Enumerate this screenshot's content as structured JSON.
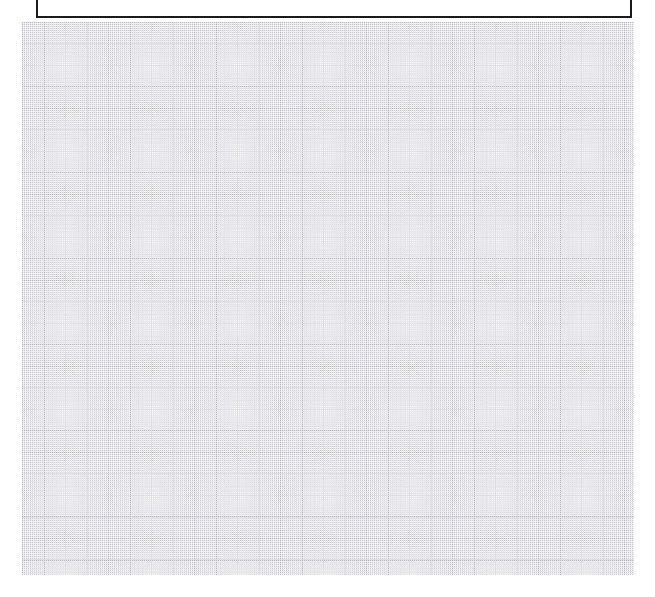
{
  "page": {
    "title": "",
    "background_color": "#ffffff",
    "width": 655,
    "height": 597
  },
  "grid": {
    "name": "graph-paper-grid",
    "visible": true,
    "minor_cell_px": 4.3,
    "major_cell_px": 21.5,
    "minor_line_color": "#ededf2",
    "major_line_color": "#b6b6c2",
    "line_style": "dotted",
    "origin_x": 22,
    "origin_y": 22,
    "width": 612,
    "height": 553,
    "major_columns": 28,
    "major_rows": 26
  },
  "content_box": {
    "name": "empty-content-box",
    "label": "",
    "text": "",
    "border_color": "#1a1a1a",
    "border_width_px": 2,
    "fill_color": "#ffffff",
    "clipped_at_top": true
  }
}
